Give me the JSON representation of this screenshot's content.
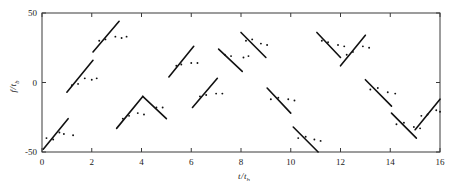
{
  "figure": {
    "title": "",
    "background": "#ffffff",
    "line_color": "#111111",
    "point_color": "#111111",
    "frame_color": "#3a3a3a"
  },
  "axes": {
    "x_title_main": "t",
    "x_title_slash": "/",
    "x_title_den": "t",
    "x_title_sub": "b",
    "y_title_main": "f",
    "y_title_slash": "/",
    "y_title_den": "t",
    "y_title_sub": "b",
    "x_ticks": [
      "0",
      "2",
      "4",
      "6",
      "8",
      "10",
      "12",
      "14",
      "16"
    ],
    "y_ticks": [
      "50",
      "0",
      "-50"
    ]
  },
  "chart_data": {
    "type": "scatter",
    "title": "",
    "xlabel": "t/t_b",
    "ylabel": "f/t_b",
    "xlim": [
      0,
      16
    ],
    "ylim": [
      -50,
      50
    ],
    "xticks": [
      0,
      2,
      4,
      6,
      8,
      10,
      12,
      14,
      16
    ],
    "yticks": [
      -50,
      0,
      50
    ],
    "grid": false,
    "legend": null,
    "segments": [
      {
        "x": [
          0.05,
          1.05
        ],
        "y": [
          -48,
          -26
        ],
        "slope": "positive"
      },
      {
        "x": [
          1.0,
          2.05
        ],
        "y": [
          -7,
          16
        ],
        "slope": "positive"
      },
      {
        "x": [
          2.05,
          3.1
        ],
        "y": [
          22,
          44
        ],
        "slope": "positive"
      },
      {
        "x": [
          3.0,
          4.05
        ],
        "y": [
          -33,
          -10
        ],
        "slope": "positive"
      },
      {
        "x": [
          4.05,
          5.0
        ],
        "y": [
          -10,
          -26
        ],
        "slope": "negative"
      },
      {
        "x": [
          5.1,
          6.1
        ],
        "y": [
          4,
          26
        ],
        "slope": "positive"
      },
      {
        "x": [
          6.05,
          7.05
        ],
        "y": [
          -18,
          3
        ],
        "slope": "positive"
      },
      {
        "x": [
          7.1,
          8.05
        ],
        "y": [
          24,
          8
        ],
        "slope": "negative"
      },
      {
        "x": [
          8.0,
          9.0
        ],
        "y": [
          36,
          18
        ],
        "slope": "negative"
      },
      {
        "x": [
          9.05,
          10.0
        ],
        "y": [
          -4,
          -22
        ],
        "slope": "negative"
      },
      {
        "x": [
          10.1,
          11.1
        ],
        "y": [
          -32,
          -50
        ],
        "slope": "negative"
      },
      {
        "x": [
          11.05,
          12.0
        ],
        "y": [
          36,
          18
        ],
        "slope": "negative"
      },
      {
        "x": [
          12.0,
          13.0
        ],
        "y": [
          12,
          34
        ],
        "slope": "positive"
      },
      {
        "x": [
          13.0,
          14.05
        ],
        "y": [
          2,
          -17
        ],
        "slope": "negative"
      },
      {
        "x": [
          14.05,
          15.05
        ],
        "y": [
          -22,
          -40
        ],
        "slope": "negative"
      },
      {
        "x": [
          15.0,
          16.0
        ],
        "y": [
          -34,
          -12
        ],
        "slope": "positive"
      }
    ],
    "points": [
      {
        "x": 0.18,
        "y": -40
      },
      {
        "x": 0.45,
        "y": -41
      },
      {
        "x": 0.7,
        "y": -36
      },
      {
        "x": 0.88,
        "y": -37
      },
      {
        "x": 1.25,
        "y": -38
      },
      {
        "x": 1.2,
        "y": -2
      },
      {
        "x": 1.45,
        "y": -1
      },
      {
        "x": 1.72,
        "y": 3
      },
      {
        "x": 2.0,
        "y": 2
      },
      {
        "x": 2.2,
        "y": 3
      },
      {
        "x": 2.3,
        "y": 30
      },
      {
        "x": 2.55,
        "y": 31
      },
      {
        "x": 2.95,
        "y": 33
      },
      {
        "x": 3.2,
        "y": 32
      },
      {
        "x": 3.4,
        "y": 33
      },
      {
        "x": 3.25,
        "y": -26
      },
      {
        "x": 3.5,
        "y": -24
      },
      {
        "x": 3.85,
        "y": -22
      },
      {
        "x": 4.1,
        "y": -23
      },
      {
        "x": 4.6,
        "y": -18
      },
      {
        "x": 4.85,
        "y": -18
      },
      {
        "x": 5.4,
        "y": 12
      },
      {
        "x": 5.6,
        "y": 13
      },
      {
        "x": 6.0,
        "y": 14
      },
      {
        "x": 6.25,
        "y": 14
      },
      {
        "x": 6.35,
        "y": -10
      },
      {
        "x": 6.6,
        "y": -9
      },
      {
        "x": 7.0,
        "y": -8
      },
      {
        "x": 7.25,
        "y": -8
      },
      {
        "x": 7.35,
        "y": 20
      },
      {
        "x": 7.6,
        "y": 19
      },
      {
        "x": 8.1,
        "y": 18
      },
      {
        "x": 8.3,
        "y": 19
      },
      {
        "x": 8.2,
        "y": 30
      },
      {
        "x": 8.45,
        "y": 31
      },
      {
        "x": 8.8,
        "y": 28
      },
      {
        "x": 9.05,
        "y": 27
      },
      {
        "x": 9.2,
        "y": -12
      },
      {
        "x": 9.5,
        "y": -11
      },
      {
        "x": 9.9,
        "y": -12
      },
      {
        "x": 10.15,
        "y": -13
      },
      {
        "x": 10.3,
        "y": -40
      },
      {
        "x": 10.6,
        "y": -39
      },
      {
        "x": 10.95,
        "y": -41
      },
      {
        "x": 11.2,
        "y": -42
      },
      {
        "x": 11.25,
        "y": 30
      },
      {
        "x": 11.5,
        "y": 29
      },
      {
        "x": 11.9,
        "y": 27
      },
      {
        "x": 12.15,
        "y": 26
      },
      {
        "x": 12.25,
        "y": 20
      },
      {
        "x": 12.5,
        "y": 22
      },
      {
        "x": 12.9,
        "y": 26
      },
      {
        "x": 13.15,
        "y": 25
      },
      {
        "x": 13.2,
        "y": -5
      },
      {
        "x": 13.5,
        "y": -4
      },
      {
        "x": 13.9,
        "y": -7
      },
      {
        "x": 14.2,
        "y": -8
      },
      {
        "x": 14.25,
        "y": -30
      },
      {
        "x": 14.55,
        "y": -29
      },
      {
        "x": 14.95,
        "y": -32
      },
      {
        "x": 15.2,
        "y": -33
      },
      {
        "x": 15.25,
        "y": -24
      },
      {
        "x": 15.5,
        "y": -23
      },
      {
        "x": 15.85,
        "y": -20
      },
      {
        "x": 16.0,
        "y": -21
      }
    ]
  }
}
